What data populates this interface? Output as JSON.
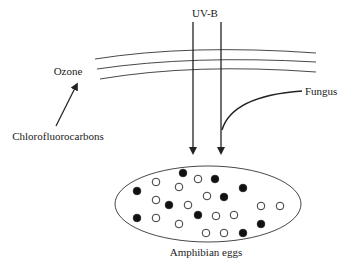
{
  "labels": {
    "uvb": "UV-B",
    "ozone": "Ozone",
    "cfc": "Chlorofluorocarbons",
    "fungus": "Fungus",
    "eggs": "Amphibian eggs"
  },
  "colors": {
    "line": "#222222",
    "filled_egg": "#111111",
    "empty_egg": "#ffffff"
  },
  "eggs": [
    {
      "x": 183,
      "y": 173,
      "filled": true
    },
    {
      "x": 156,
      "y": 182,
      "filled": false
    },
    {
      "x": 198,
      "y": 179,
      "filled": false
    },
    {
      "x": 215,
      "y": 179,
      "filled": true
    },
    {
      "x": 179,
      "y": 187,
      "filled": false
    },
    {
      "x": 137,
      "y": 191,
      "filled": true
    },
    {
      "x": 243,
      "y": 188,
      "filled": true
    },
    {
      "x": 156,
      "y": 200,
      "filled": false
    },
    {
      "x": 207,
      "y": 196,
      "filled": false
    },
    {
      "x": 224,
      "y": 197,
      "filled": true
    },
    {
      "x": 169,
      "y": 205,
      "filled": true
    },
    {
      "x": 188,
      "y": 205,
      "filled": false
    },
    {
      "x": 261,
      "y": 206,
      "filled": false
    },
    {
      "x": 280,
      "y": 206,
      "filled": false
    },
    {
      "x": 137,
      "y": 218,
      "filled": true
    },
    {
      "x": 156,
      "y": 218,
      "filled": false
    },
    {
      "x": 198,
      "y": 215,
      "filled": true
    },
    {
      "x": 216,
      "y": 216,
      "filled": false
    },
    {
      "x": 234,
      "y": 215,
      "filled": false
    },
    {
      "x": 179,
      "y": 224,
      "filled": false
    },
    {
      "x": 261,
      "y": 224,
      "filled": true
    },
    {
      "x": 206,
      "y": 233,
      "filled": false
    },
    {
      "x": 224,
      "y": 233,
      "filled": false
    },
    {
      "x": 243,
      "y": 233,
      "filled": true
    }
  ]
}
